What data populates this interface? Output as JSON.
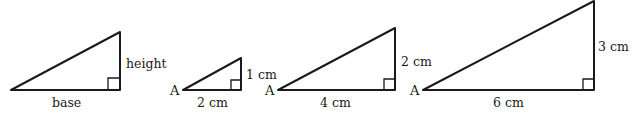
{
  "figure": {
    "triangles": [
      {
        "id": "generic",
        "vertex_label": "",
        "base_label": "base",
        "height_label": "height",
        "base_value": 2,
        "height_value": 1
      },
      {
        "id": "small",
        "vertex_label": "A",
        "base_label": "2 cm",
        "height_label": "1 cm",
        "base_value": 2,
        "height_value": 1
      },
      {
        "id": "medium",
        "vertex_label": "A",
        "base_label": "4 cm",
        "height_label": "2 cm",
        "base_value": 4,
        "height_value": 2
      },
      {
        "id": "large",
        "vertex_label": "A",
        "base_label": "6 cm",
        "height_label": "3 cm",
        "base_value": 6,
        "height_value": 3
      }
    ]
  }
}
